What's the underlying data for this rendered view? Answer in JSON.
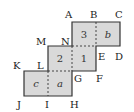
{
  "diagram": {
    "type": "net of a cube (staircase of six squares)",
    "fill_color": "#d9d9d9",
    "stroke_color": "#333333",
    "faces": [
      {
        "id": "3",
        "label": "3",
        "italic": false,
        "x": 72,
        "y": 22
      },
      {
        "id": "b",
        "label": "b",
        "italic": true,
        "x": 96,
        "y": 22
      },
      {
        "id": "2",
        "label": "2",
        "italic": false,
        "x": 48,
        "y": 46
      },
      {
        "id": "1",
        "label": "1",
        "italic": false,
        "x": 72,
        "y": 46
      },
      {
        "id": "c",
        "label": "c",
        "italic": true,
        "x": 24,
        "y": 71
      },
      {
        "id": "a",
        "label": "a",
        "italic": true,
        "x": 48,
        "y": 71
      }
    ],
    "vertices": [
      {
        "name": "A",
        "label": "A",
        "x": 70,
        "y": 16
      },
      {
        "name": "B",
        "label": "B",
        "x": 95,
        "y": 16
      },
      {
        "name": "C",
        "label": "C",
        "x": 121,
        "y": 16
      },
      {
        "name": "D",
        "label": "D",
        "x": 121,
        "y": 60
      },
      {
        "name": "E",
        "label": "E",
        "x": 100,
        "y": 60
      },
      {
        "name": "F",
        "label": "F",
        "x": 100,
        "y": 84
      },
      {
        "name": "G",
        "label": "G",
        "x": 78,
        "y": 84
      },
      {
        "name": "H",
        "label": "H",
        "x": 76,
        "y": 107
      },
      {
        "name": "I",
        "label": "I",
        "x": 47,
        "y": 107
      },
      {
        "name": "J",
        "label": "J",
        "x": 21,
        "y": 107
      },
      {
        "name": "K",
        "label": "K",
        "x": 19,
        "y": 70
      },
      {
        "name": "L",
        "label": "L",
        "x": 42,
        "y": 70
      },
      {
        "name": "M",
        "label": "M",
        "x": 43,
        "y": 46
      },
      {
        "name": "N",
        "label": "N",
        "x": 66,
        "y": 46
      }
    ]
  }
}
